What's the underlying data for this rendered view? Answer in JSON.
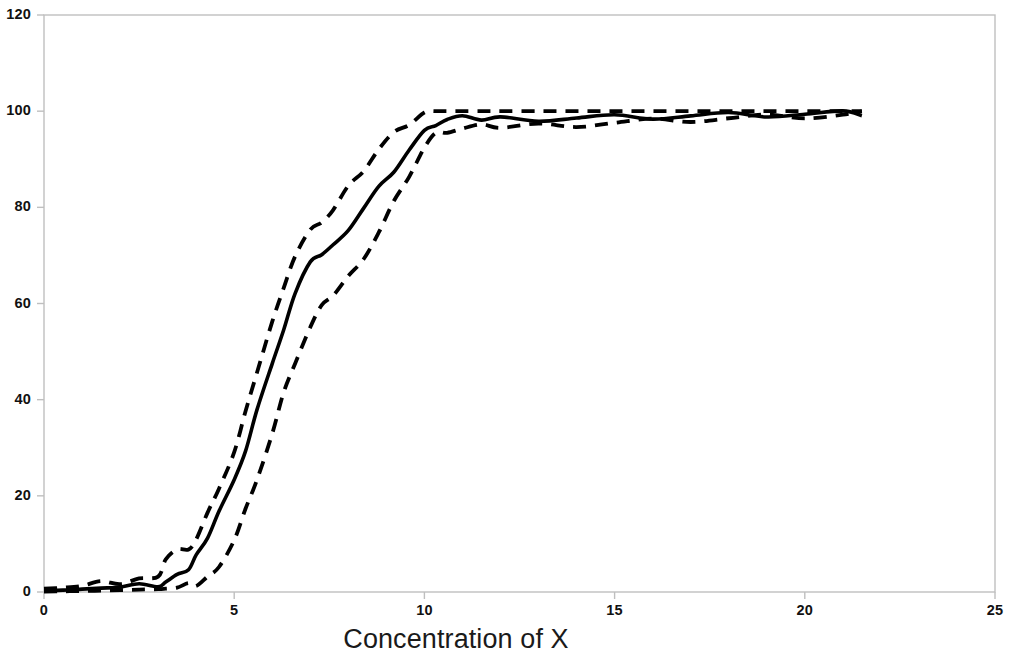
{
  "chart_data": {
    "type": "line",
    "title": "",
    "subtitle": "",
    "xlabel": "Concentration of X",
    "ylabel": "",
    "xlim": [
      0,
      25
    ],
    "ylim": [
      0,
      120
    ],
    "xticks": [
      0,
      5,
      10,
      15,
      20,
      25
    ],
    "yticks": [
      0,
      20,
      40,
      60,
      80,
      100,
      120
    ],
    "grid": false,
    "legend": "none",
    "plot_frame": "box",
    "x": [
      0.0,
      0.5,
      1.0,
      1.5,
      2.0,
      2.5,
      3.0,
      3.2,
      3.5,
      3.8,
      4.0,
      4.3,
      4.6,
      5.0,
      5.3,
      5.6,
      6.0,
      6.3,
      6.6,
      7.0,
      7.3,
      7.6,
      8.0,
      8.4,
      8.8,
      9.2,
      9.6,
      10.0,
      10.3,
      10.6,
      11.0,
      11.5,
      12.0,
      13.0,
      14.0,
      15.0,
      16.0,
      17.0,
      18.0,
      19.0,
      20.0,
      21.0,
      21.5
    ],
    "series": [
      {
        "name": "Fitted curve",
        "style": "solid",
        "color": "#000000",
        "values": [
          0.3,
          0.4,
          0.6,
          0.8,
          1.0,
          1.2,
          1.6,
          2.0,
          3.0,
          5.0,
          7.5,
          12.0,
          17.0,
          23.0,
          30.0,
          38.0,
          47.0,
          55.0,
          62.0,
          68.0,
          70.5,
          72.0,
          76.0,
          80.0,
          84.0,
          88.0,
          92.0,
          95.5,
          97.5,
          98.2,
          98.4,
          98.5,
          98.6,
          98.7,
          98.8,
          98.9,
          99.0,
          99.1,
          99.2,
          99.3,
          99.3,
          99.4,
          99.4
        ]
      },
      {
        "name": "Upper confidence bound",
        "style": "dashed",
        "color": "#000000",
        "values": [
          0.7,
          0.9,
          1.2,
          1.6,
          2.0,
          2.6,
          4.0,
          7.0,
          8.5,
          9.5,
          11.0,
          16.0,
          22.0,
          29.0,
          37.0,
          46.0,
          56.0,
          64.0,
          70.0,
          75.0,
          77.5,
          79.5,
          84.0,
          88.0,
          92.0,
          95.0,
          97.5,
          99.5,
          100.0,
          100.0,
          100.0,
          100.0,
          100.0,
          100.0,
          100.0,
          100.0,
          100.0,
          100.0,
          100.0,
          100.0,
          100.0,
          100.0,
          100.0
        ]
      },
      {
        "name": "Lower confidence bound",
        "style": "dashed",
        "color": "#000000",
        "values": [
          0.1,
          0.15,
          0.2,
          0.3,
          0.4,
          0.5,
          0.6,
          0.7,
          0.9,
          1.2,
          1.6,
          3.0,
          6.0,
          11.0,
          17.0,
          24.0,
          33.0,
          41.0,
          48.0,
          55.0,
          59.0,
          62.0,
          65.5,
          70.0,
          75.0,
          81.0,
          87.0,
          92.5,
          95.0,
          96.0,
          96.3,
          96.6,
          96.9,
          97.2,
          97.5,
          97.8,
          98.1,
          98.4,
          98.6,
          98.8,
          99.0,
          99.2,
          99.3
        ]
      }
    ]
  },
  "axes": {
    "y_tick_labels": [
      "0",
      "20",
      "40",
      "60",
      "80",
      "100",
      "120"
    ],
    "x_tick_labels": [
      "0",
      "5",
      "10",
      "15",
      "20",
      "25"
    ]
  },
  "labels": {
    "x_axis_title": "Concentration of X"
  },
  "colors": {
    "line": "#000000",
    "frame": "#bfbfbf",
    "text": "#111111",
    "background": "#ffffff"
  }
}
